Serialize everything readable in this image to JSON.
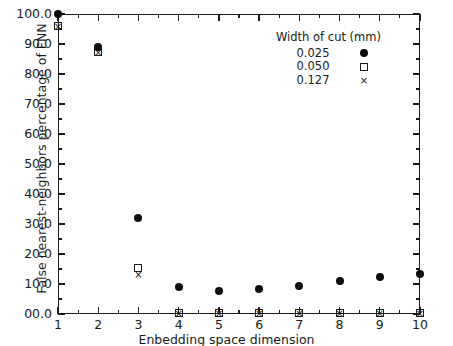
{
  "chart_data": {
    "type": "scatter",
    "title": "",
    "xlabel": "Enbedding space dimension",
    "ylabel": "False nearest-neighbors percentage of FNN",
    "xlim": [
      1,
      10
    ],
    "ylim": [
      0,
      100
    ],
    "grid": false,
    "x": [
      1,
      2,
      3,
      4,
      5,
      6,
      7,
      8,
      9,
      10
    ],
    "xticklabels": [
      "1",
      "2",
      "3",
      "4",
      "5",
      "6",
      "7",
      "8",
      "9",
      "10"
    ],
    "yticks": [
      0,
      10,
      20,
      30,
      40,
      50,
      60,
      70,
      80,
      90,
      100
    ],
    "yticklabels": [
      "00.0",
      "10.0",
      "20.0",
      "30.0",
      "40.0",
      "50.0",
      "60.0",
      "70.0",
      "80.0",
      "90.0",
      "100.0"
    ],
    "legend": {
      "title": "Width of cut (mm)",
      "position": "upper right",
      "entries": [
        {
          "label": "0.025",
          "marker": "filled-circle"
        },
        {
          "label": "0.050",
          "marker": "open-square"
        },
        {
          "label": "0.127",
          "marker": "cross"
        }
      ]
    },
    "series": [
      {
        "name": "0.025",
        "marker": "filled-circle",
        "values": [
          100.0,
          89.0,
          32.0,
          9.0,
          7.8,
          8.5,
          9.5,
          11.0,
          12.5,
          13.5
        ]
      },
      {
        "name": "0.050",
        "marker": "open-square",
        "values": [
          96.0,
          87.5,
          15.5,
          0.5,
          0.5,
          0.5,
          0.5,
          0.5,
          0.5,
          0.5
        ]
      },
      {
        "name": "0.127",
        "marker": "cross",
        "values": [
          96.0,
          87.5,
          13.5,
          0.5,
          0.5,
          0.5,
          0.5,
          0.5,
          0.5,
          0.5
        ]
      }
    ]
  }
}
